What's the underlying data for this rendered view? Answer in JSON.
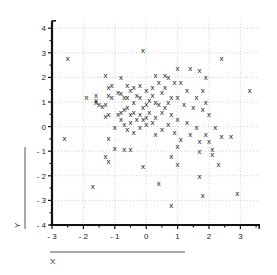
{
  "chart_data": {
    "type": "scatter",
    "title": "",
    "xlabel": "X",
    "ylabel": "Y",
    "xlim": [
      -3,
      3.6
    ],
    "ylim": [
      -4,
      4.3
    ],
    "xticks": [
      -3,
      -2,
      -1,
      0,
      1,
      2,
      3
    ],
    "yticks": [
      -4,
      -3,
      -2,
      -1,
      0,
      1,
      2,
      3,
      4
    ],
    "grid": true,
    "grid_style": "dotted",
    "marker": "x",
    "legend": null,
    "series": [
      {
        "name": "points",
        "points": [
          [
            -2.5,
            2.8
          ],
          [
            -2.6,
            -0.45
          ],
          [
            -1.2,
            -0.45
          ],
          [
            -0.1,
            3.1
          ],
          [
            -0.8,
            2.0
          ],
          [
            -1.3,
            2.1
          ],
          [
            -1.2,
            1.6
          ],
          [
            -1.1,
            1.7
          ],
          [
            -1.9,
            1.2
          ],
          [
            -1.6,
            1.3
          ],
          [
            -1.6,
            1.0
          ],
          [
            -1.5,
            0.9
          ],
          [
            -1.4,
            0.85
          ],
          [
            -1.3,
            0.9
          ],
          [
            -1.2,
            1.3
          ],
          [
            -1.1,
            1.2
          ],
          [
            -1.2,
            0.5
          ],
          [
            -1.3,
            0.45
          ],
          [
            -1.6,
            1.1
          ],
          [
            -0.9,
            1.4
          ],
          [
            -0.8,
            1.35
          ],
          [
            -0.7,
            1.2
          ],
          [
            -0.6,
            1.2
          ],
          [
            -0.5,
            1.5
          ],
          [
            -0.6,
            1.7
          ],
          [
            -0.4,
            1.6
          ],
          [
            -0.3,
            1.3
          ],
          [
            -0.2,
            1.2
          ],
          [
            -0.4,
            1.0
          ],
          [
            -0.6,
            0.8
          ],
          [
            -0.7,
            0.7
          ],
          [
            -0.8,
            0.6
          ],
          [
            -0.9,
            0.5
          ],
          [
            -0.5,
            0.5
          ],
          [
            -0.4,
            0.6
          ],
          [
            -0.2,
            0.5
          ],
          [
            -0.1,
            0.8
          ],
          [
            0.0,
            0.9
          ],
          [
            0.1,
            1.1
          ],
          [
            0.2,
            1.3
          ],
          [
            0.3,
            1.0
          ],
          [
            0.4,
            0.9
          ],
          [
            0.1,
            0.6
          ],
          [
            0.0,
            0.4
          ],
          [
            -0.1,
            0.3
          ],
          [
            -0.3,
            0.3
          ],
          [
            -0.5,
            0.2
          ],
          [
            -0.7,
            0.1
          ],
          [
            -0.8,
            0.3
          ],
          [
            -1.0,
            0.0
          ],
          [
            -0.6,
            -0.1
          ],
          [
            -0.4,
            -0.2
          ],
          [
            -0.2,
            0.0
          ],
          [
            0.0,
            0.1
          ],
          [
            0.2,
            0.2
          ],
          [
            0.3,
            0.4
          ],
          [
            0.5,
            0.6
          ],
          [
            0.6,
            0.8
          ],
          [
            0.7,
            1.0
          ],
          [
            0.8,
            1.2
          ],
          [
            0.5,
            1.4
          ],
          [
            0.6,
            1.6
          ],
          [
            0.4,
            1.8
          ],
          [
            0.2,
            1.6
          ],
          [
            0.0,
            1.5
          ],
          [
            -0.2,
            1.7
          ],
          [
            0.3,
            2.1
          ],
          [
            0.6,
            2.1
          ],
          [
            0.7,
            2.0
          ],
          [
            1.0,
            2.4
          ],
          [
            1.4,
            2.4
          ],
          [
            1.7,
            2.3
          ],
          [
            0.9,
            1.8
          ],
          [
            1.1,
            1.8
          ],
          [
            1.3,
            1.5
          ],
          [
            1.6,
            1.2
          ],
          [
            1.9,
            1.0
          ],
          [
            1.0,
            1.2
          ],
          [
            1.2,
            0.9
          ],
          [
            1.5,
            0.8
          ],
          [
            1.8,
            0.7
          ],
          [
            0.8,
            0.5
          ],
          [
            1.0,
            0.3
          ],
          [
            1.3,
            0.2
          ],
          [
            1.6,
            0.0
          ],
          [
            1.9,
            -0.3
          ],
          [
            0.7,
            0.1
          ],
          [
            0.5,
            -0.1
          ],
          [
            0.3,
            -0.3
          ],
          [
            0.9,
            -0.2
          ],
          [
            1.1,
            -0.5
          ],
          [
            1.4,
            -0.3
          ],
          [
            2.4,
            -0.4
          ],
          [
            1.7,
            -0.6
          ],
          [
            1.0,
            -0.8
          ],
          [
            0.8,
            -1.2
          ],
          [
            1.7,
            -1.0
          ],
          [
            2.1,
            -1.1
          ],
          [
            -0.5,
            -0.9
          ],
          [
            -0.7,
            -0.9
          ],
          [
            -1.0,
            -0.85
          ],
          [
            -1.3,
            -1.2
          ],
          [
            -1.2,
            -1.4
          ],
          [
            -0.1,
            -1.6
          ],
          [
            -1.7,
            -2.4
          ],
          [
            0.4,
            -2.3
          ],
          [
            1.0,
            -1.5
          ],
          [
            1.7,
            -2.0
          ],
          [
            1.8,
            -2.8
          ],
          [
            0.8,
            -3.2
          ],
          [
            2.9,
            -2.7
          ],
          [
            2.1,
            -0.9
          ],
          [
            2.7,
            -0.4
          ],
          [
            2.4,
            2.8
          ],
          [
            3.3,
            1.5
          ],
          [
            1.9,
            2.0
          ],
          [
            1.8,
            1.5
          ],
          [
            2.0,
            0.5
          ],
          [
            2.2,
            0.0
          ],
          [
            2.0,
            -0.6
          ],
          [
            2.3,
            -1.5
          ]
        ]
      }
    ]
  },
  "axes": {
    "x_label": "X",
    "y_label": "Y",
    "x_tick_labels": [
      "-3",
      "-2",
      "-1",
      "0",
      "1",
      "2",
      "3"
    ],
    "y_tick_labels": [
      "4",
      "3",
      "2",
      "1",
      "0",
      "-1",
      "-2",
      "-3",
      "-4"
    ]
  },
  "style": {
    "marker_color": "#111111",
    "axis_color": "#111111",
    "grid_color": "#bbbbbb",
    "label_color": "#222222"
  }
}
